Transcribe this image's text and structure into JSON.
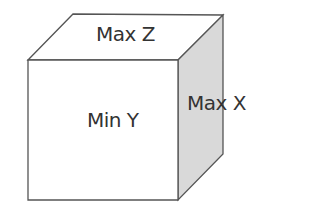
{
  "diagram": {
    "type": "cube-faces",
    "faces": {
      "top": {
        "label": "Max Z",
        "fill": "#ffffff"
      },
      "front": {
        "label": "Min Y",
        "fill": "#ffffff"
      },
      "side": {
        "label": "Max X",
        "fill": "#d9d9d9"
      }
    },
    "stroke_color": "#555555"
  }
}
